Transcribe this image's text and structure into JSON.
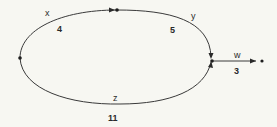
{
  "diagram": {
    "type": "directed-graph",
    "nodes": [
      {
        "id": "left"
      },
      {
        "id": "top"
      },
      {
        "id": "right"
      },
      {
        "id": "sink"
      }
    ],
    "edges": [
      {
        "id": "x",
        "label": "x",
        "weight": "4",
        "from": "left",
        "to": "top"
      },
      {
        "id": "y",
        "label": "y",
        "weight": "5",
        "from": "top",
        "to": "right"
      },
      {
        "id": "z",
        "label": "z",
        "weight": "11",
        "from": "left",
        "to": "right"
      },
      {
        "id": "w",
        "label": "w",
        "weight": "3",
        "from": "right",
        "to": "sink"
      }
    ]
  }
}
